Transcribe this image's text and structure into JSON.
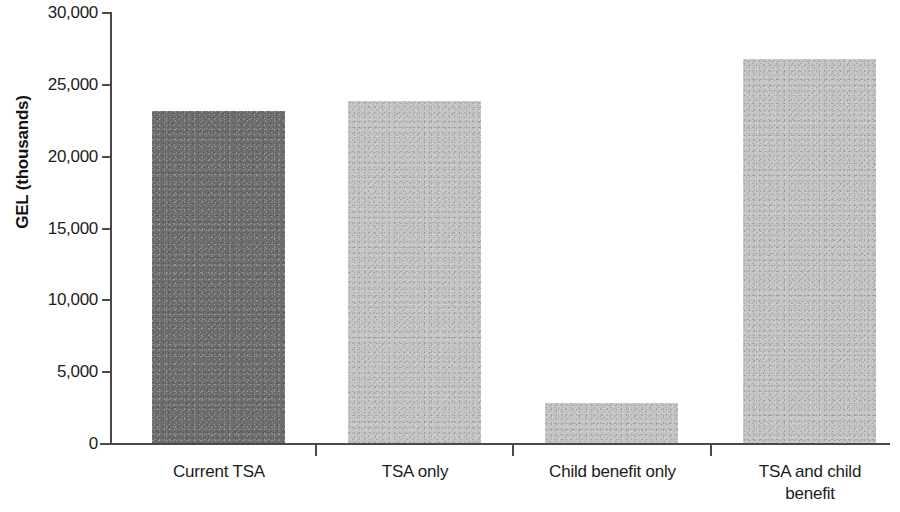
{
  "chart_data": {
    "type": "bar",
    "title": "",
    "subtitle": "",
    "xlabel": "",
    "ylabel": "GEL (thousands)",
    "categories": [
      "Current TSA",
      "TSA only",
      "Child benefit only",
      "TSA and child benefit"
    ],
    "values": [
      23100,
      23800,
      2780,
      26700
    ],
    "series": [
      {
        "name": "GEL (thousands)",
        "values": [
          23100,
          23800,
          2780,
          26700
        ]
      }
    ],
    "bar_colors": [
      "#6e6e6e",
      "#c3c3c3",
      "#c3c3c3",
      "#c3c3c3"
    ],
    "ylim": [
      0,
      30000
    ],
    "ytick_values": [
      0,
      5000,
      10000,
      15000,
      20000,
      25000,
      30000
    ],
    "ytick_labels": [
      "0",
      "5,000",
      "10,000",
      "15,000",
      "20,000",
      "25,000",
      "30,000"
    ],
    "grid": false,
    "legend": null,
    "legend_position": "none",
    "annotations": []
  },
  "axis": {
    "y_title": "GEL (thousands)",
    "ticks": [
      {
        "label": "30,000",
        "value": 30000
      },
      {
        "label": "25,000",
        "value": 25000
      },
      {
        "label": "20,000",
        "value": 20000
      },
      {
        "label": "15,000",
        "value": 15000
      },
      {
        "label": "10,000",
        "value": 10000
      },
      {
        "label": "5,000",
        "value": 5000
      },
      {
        "label": "0",
        "value": 0
      }
    ]
  },
  "categories": [
    {
      "line1": "Current TSA",
      "line2": ""
    },
    {
      "line1": "TSA only",
      "line2": ""
    },
    {
      "line1": "Child benefit only",
      "line2": ""
    },
    {
      "line1": "TSA and child",
      "line2": "benefit"
    }
  ]
}
